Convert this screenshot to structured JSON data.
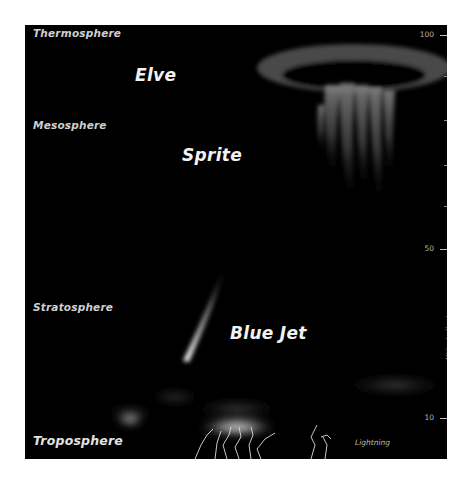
{
  "diagram": {
    "background_color": "#000000",
    "layers": [
      {
        "name": "Thermosphere",
        "y": 9
      },
      {
        "name": "Mesosphere",
        "y": 96
      },
      {
        "name": "Stratosphere",
        "y": 279
      },
      {
        "name": "Troposphere",
        "y": 411
      }
    ],
    "events": [
      {
        "name": "Elve"
      },
      {
        "name": "Sprite"
      },
      {
        "name": "Blue Jet"
      },
      {
        "name": "Lightning"
      }
    ],
    "axis": {
      "title": "Altitude (km)",
      "ticks": [
        "100",
        "50",
        "10"
      ]
    }
  }
}
